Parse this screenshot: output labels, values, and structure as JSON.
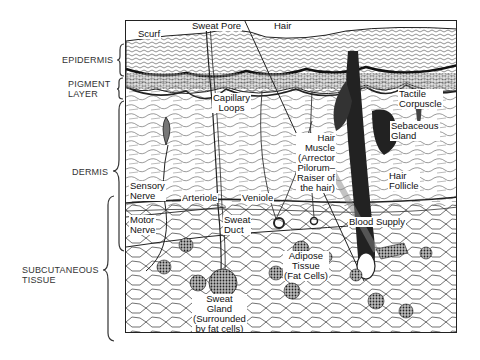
{
  "diagram": {
    "layers": [
      {
        "id": "epidermis",
        "label": "EPIDERMIS"
      },
      {
        "id": "pigment",
        "label": "PIGMENT\nLAYER",
        "line1": "PIGMENT",
        "line2": "LAYER"
      },
      {
        "id": "dermis",
        "label": "DERMIS"
      },
      {
        "id": "subcutaneous",
        "label": "SUBCUTANEOUS TISSUE",
        "line1": "SUBCUTANEOUS",
        "line2": "TISSUE"
      }
    ],
    "labels": {
      "scurf": "Scurf",
      "sweat_pore": "Sweat Pore",
      "hair": "Hair",
      "tactile_corpuscle": [
        "Tactile",
        "Corpuscle"
      ],
      "capillary_loops": [
        "Capillary",
        "Loops"
      ],
      "sebaceous_gland": [
        "Sebaceous",
        "Gland"
      ],
      "hair_muscle": [
        "Hair",
        "Muscle",
        "(Arrector",
        "Pilorum–",
        "Raiser of",
        "the hair)"
      ],
      "arteriole": "Arteriole",
      "veniole": "Veniole",
      "hair_follicle": [
        "Hair",
        "Follicle"
      ],
      "sensory_nerve": [
        "Sensory",
        "Nerve"
      ],
      "blood_supply": "Blood Supply",
      "motor_nerve": [
        "Motor",
        "Nerve"
      ],
      "sweat_duct": [
        "Sweat",
        "Duct"
      ],
      "adipose_tissue": [
        "Adipose",
        "Tissue",
        "(Fat Cells)"
      ],
      "sweat_gland": [
        "Sweat",
        "Gland",
        "(Surrounded",
        "by fat cells)"
      ]
    },
    "colors": {
      "ink": "#1a1a1a",
      "paper": "#ffffff",
      "shade": "#555555"
    }
  }
}
